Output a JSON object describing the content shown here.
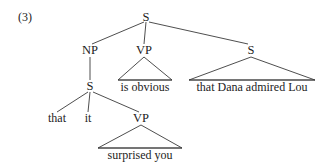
{
  "figure": {
    "example_number": "(3)",
    "type": "syntactic-constituency-tree",
    "sentence": "that it surprised you is obvious that Dana admired Lou"
  },
  "nodes": {
    "root_s": "S",
    "np": "NP",
    "vp_matrix": "VP",
    "s_extraposed": "S",
    "s_embedded": "S",
    "vp_embedded": "VP"
  },
  "leaves": {
    "that": "that",
    "it": "it",
    "surprised_you": "surprised you",
    "is_obvious": "is obvious",
    "that_dana_admired_lou": "that Dana admired Lou"
  },
  "colors": {
    "background": "#ffffff",
    "text": "#1c1c1c",
    "line": "#3a3a3a"
  }
}
